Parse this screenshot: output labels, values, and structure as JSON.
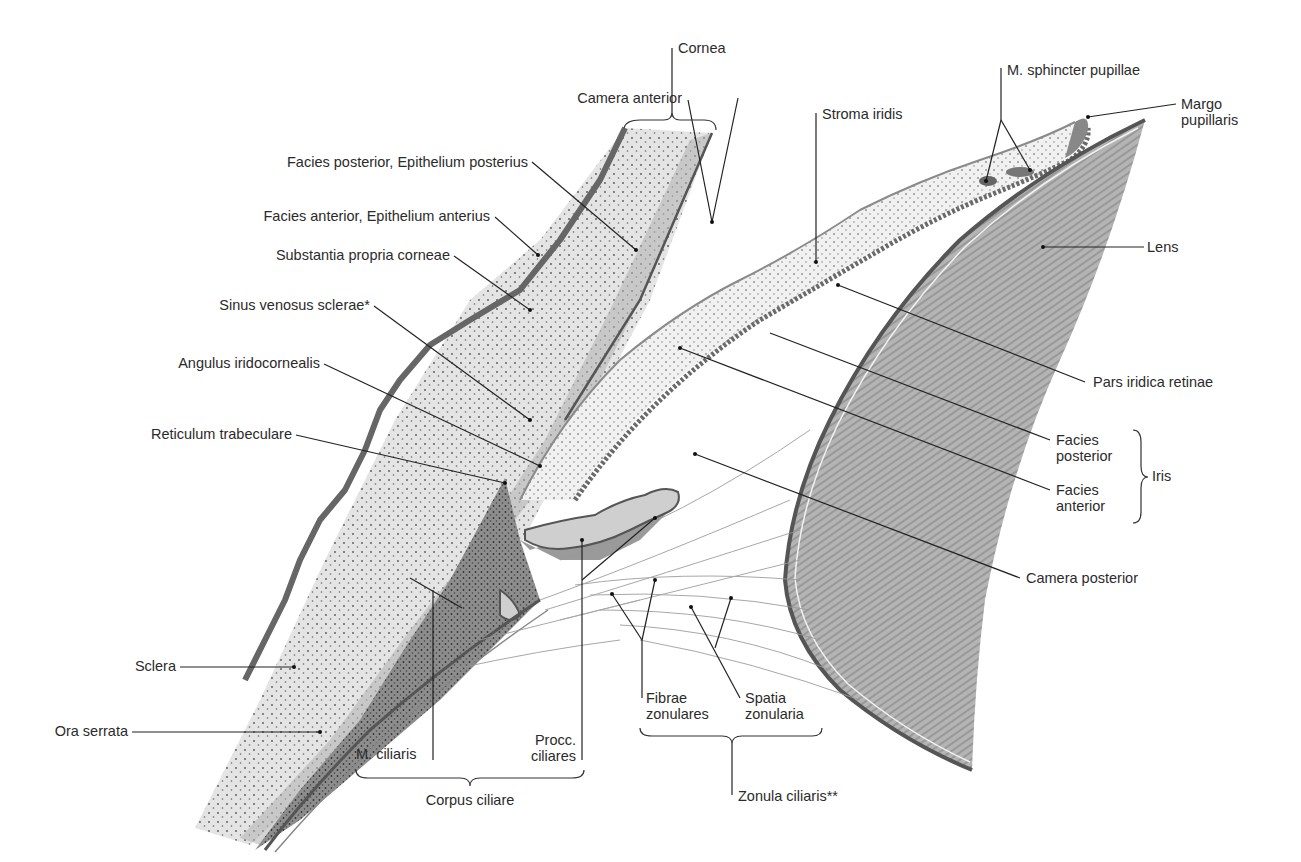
{
  "figure": {
    "colors": {
      "ink": "#222222",
      "tissue_light": "#e6e6e6",
      "tissue_mid": "#b9b9b9",
      "tissue_dark": "#8a8a8a",
      "epithelium": "#6f6f6f",
      "background": "#ffffff"
    }
  },
  "labels": {
    "cornea": "Cornea",
    "camera_anterior": "Camera anterior",
    "facies_posterior_epithelium": "Facies posterior, Epithelium posterius",
    "facies_anterior_epithelium": "Facies anterior, Epithelium anterius",
    "substantia_propria": "Substantia propria corneae",
    "sinus_venosus": "Sinus venosus sclerae*",
    "angulus_iridocornealis": "Angulus iridocornealis",
    "reticulum_trabeculare": "Reticulum trabeculare",
    "sclera": "Sclera",
    "ora_serrata": "Ora serrata",
    "m_ciliaris": "M. ciliaris",
    "procc_ciliares_1": "Procc.",
    "procc_ciliares_2": "ciliares",
    "corpus_ciliare": "Corpus ciliare",
    "fibrae_zonulares_1": "Fibrae",
    "fibrae_zonulares_2": "zonulares",
    "spatia_zonularia_1": "Spatia",
    "spatia_zonularia_2": "zonularia",
    "zonula_ciliaris": "Zonula ciliaris**",
    "stroma_iridis": "Stroma iridis",
    "m_sphincter_pupillae": "M. sphincter pupillae",
    "margo_pupillaris_1": "Margo",
    "margo_pupillaris_2": "pupillaris",
    "lens": "Lens",
    "pars_iridica_retinae": "Pars iridica retinae",
    "facies_posterior_1": "Facies",
    "facies_posterior_2": "posterior",
    "facies_anterior_1": "Facies",
    "facies_anterior_2": "anterior",
    "iris": "Iris",
    "camera_posterior": "Camera posterior"
  }
}
